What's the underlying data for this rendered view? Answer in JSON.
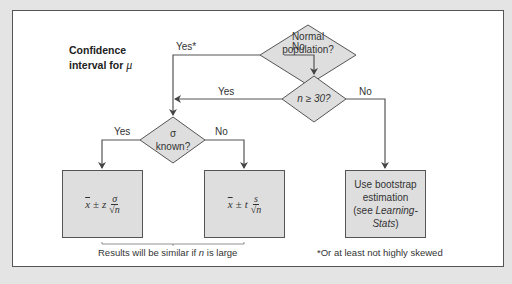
{
  "title": {
    "line1": "Confidence",
    "line2_prefix": "interval for ",
    "line2_symbol": "μ"
  },
  "nodes": {
    "normal": {
      "line1": "Normal",
      "line2": "population?"
    },
    "n30": {
      "text": "n ≥ 30?"
    },
    "sigma": {
      "line1": "σ",
      "line2": "known?"
    },
    "z_box": {
      "xbar": "x",
      "pm": "±",
      "stat": "z",
      "num": "σ",
      "den": "√n"
    },
    "t_box": {
      "xbar": "x",
      "pm": "±",
      "stat": "t",
      "num": "s",
      "den": "√n"
    },
    "bootstrap": {
      "line1": "Use bootstrap",
      "line2": "estimation",
      "line3_prefix": "(see ",
      "line3_italic": "Learning-",
      "line4_italic": "Stats",
      "line4_suffix": ")"
    }
  },
  "edges": {
    "normal_yes": "Yes*",
    "normal_no": "No",
    "n30_yes": "Yes",
    "n30_no": "No",
    "sigma_yes": "Yes",
    "sigma_no": "No"
  },
  "notes": {
    "similar_prefix": "Results will be similar if ",
    "similar_var": "n",
    "similar_suffix": " is large",
    "footnote": "*Or at least not highly skewed"
  },
  "colors": {
    "background": "#e4e4e4",
    "panel": "#ffffff",
    "shape_fill": "#dedede",
    "line": "#555555"
  }
}
